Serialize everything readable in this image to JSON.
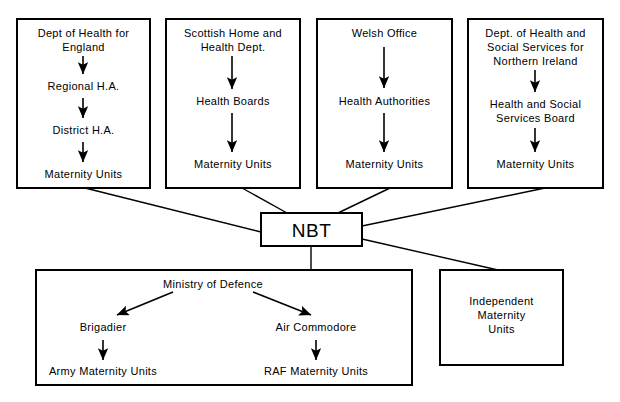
{
  "diagram": {
    "hub": {
      "label": "NBT"
    },
    "columns": [
      {
        "id": "england",
        "nodes": [
          {
            "label": "Dept of Health for England"
          },
          {
            "label": "Regional H.A."
          },
          {
            "label": "District H.A."
          },
          {
            "label": "Maternity Units"
          }
        ]
      },
      {
        "id": "scotland",
        "nodes": [
          {
            "label": "Scottish Home and Health Dept."
          },
          {
            "label": "Health Boards"
          },
          {
            "label": "Maternity Units"
          }
        ]
      },
      {
        "id": "wales",
        "nodes": [
          {
            "label": "Welsh Office"
          },
          {
            "label": "Health Authorities"
          },
          {
            "label": "Maternity Units"
          }
        ]
      },
      {
        "id": "northern-ireland",
        "nodes": [
          {
            "label": "Dept. of Health and Social Services for Northern Ireland"
          },
          {
            "label": "Health and Social Services Board"
          },
          {
            "label": "Maternity Units"
          }
        ]
      }
    ],
    "defence": {
      "root": "Ministry of Defence",
      "branches": [
        {
          "head": "Brigadier",
          "unit": "Army Maternity Units"
        },
        {
          "head": "Air Commodore",
          "unit": "RAF Maternity Units"
        }
      ]
    },
    "independent": {
      "label": "Independent Maternity Units",
      "lines": [
        "Independent",
        "Maternity",
        "Units"
      ]
    },
    "colors": {
      "stroke": "#000000",
      "fill": "#ffffff",
      "text": "#000000"
    }
  }
}
